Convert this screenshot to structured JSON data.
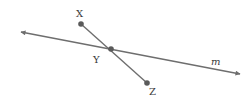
{
  "diagram": {
    "type": "geometry",
    "colors": {
      "line": "#6e6e6e",
      "point": "#5a5a5a",
      "label": "#3a3a3a",
      "background": "#ffffff"
    },
    "line_m": {
      "label": "m",
      "from": [
        21,
        32
      ],
      "to": [
        240,
        74
      ],
      "arrows": "both",
      "label_pos": [
        216,
        64
      ]
    },
    "segment_xz": {
      "from": "X",
      "to": "Z"
    },
    "points": [
      {
        "name": "X",
        "label": "X",
        "pos": [
          81,
          24
        ],
        "label_pos": [
          80,
          16
        ]
      },
      {
        "name": "Y",
        "label": "Y",
        "pos": [
          111,
          49
        ],
        "label_pos": [
          97,
          63
        ]
      },
      {
        "name": "Z",
        "label": "Z",
        "pos": [
          147,
          83
        ],
        "label_pos": [
          153,
          94
        ]
      }
    ]
  }
}
